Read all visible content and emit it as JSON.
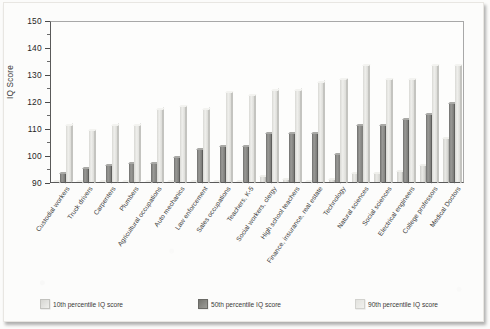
{
  "chart_data": {
    "type": "bar",
    "title": "",
    "xlabel": "",
    "ylabel": "IQ Score",
    "ylim": [
      90,
      150
    ],
    "ytick_values": [
      90,
      100,
      110,
      120,
      130,
      140,
      150
    ],
    "ytick_labels": [
      "90",
      "100",
      "110",
      "120",
      "130",
      "140",
      "150"
    ],
    "yminor_step": 5,
    "grid": false,
    "legend_position": "bottom",
    "categories": [
      "Custodial workers",
      "Truck drivers",
      "Carpenters",
      "Plumbers",
      "Agricultural occupations",
      "Auto mechanics",
      "Law enforcement",
      "Sales occupations",
      "Teachers, K-5",
      "Social workers, clergy",
      "High school teachers",
      "Finance, insurance, real estate",
      "Technology",
      "Natural sciences",
      "Social sciences",
      "Electrical engineers",
      "College professors",
      "Medical Doctors"
    ],
    "series": [
      {
        "name": "10th percentile IQ score",
        "color": "#e3e3df",
        "values": [
          90,
          90,
          90,
          90,
          90,
          90,
          90,
          90,
          90,
          92,
          91,
          90,
          91,
          93,
          93,
          94,
          96,
          106
        ]
      },
      {
        "name": "50th percentile IQ score",
        "color": "#85857f",
        "values": [
          93,
          95,
          96,
          97,
          97,
          99,
          102,
          103,
          103,
          108,
          108,
          108,
          100,
          111,
          111,
          113,
          115,
          119
        ]
      },
      {
        "name": "90th percentile IQ score",
        "color": "#eaeae6",
        "values": [
          111,
          109,
          111,
          111,
          117,
          118,
          117,
          123,
          122,
          124,
          124,
          127,
          128,
          133,
          128,
          128,
          133,
          133
        ]
      }
    ]
  },
  "legend": {
    "items": [
      {
        "label": "10th percentile IQ score",
        "swatch": "swatch-10th"
      },
      {
        "label": "50th percentile IQ score",
        "swatch": "swatch-50th"
      },
      {
        "label": "90th percentile IQ score",
        "swatch": "swatch-90th"
      }
    ]
  }
}
